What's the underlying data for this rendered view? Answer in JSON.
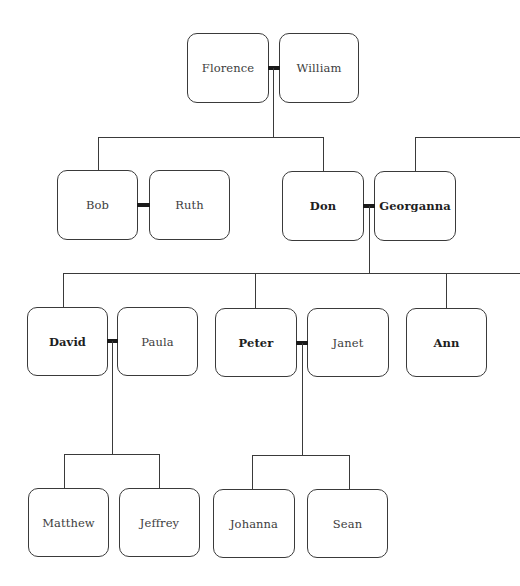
{
  "diagram": {
    "type": "family-tree",
    "colors": {
      "line": "#3a3a3a",
      "marriage_bar": "#1a1a1a",
      "box_border": "#3a3a3a",
      "background": "#ffffff"
    },
    "generations": [
      {
        "level": 1,
        "couples": [
          {
            "partner1": "Florence",
            "partner2": "William"
          }
        ]
      },
      {
        "level": 2,
        "couples": [
          {
            "partner1": "Bob",
            "partner2": "Ruth"
          },
          {
            "partner1": "Don",
            "partner2": "Georganna"
          }
        ]
      },
      {
        "level": 3,
        "couples": [
          {
            "partner1": "David",
            "partner2": "Paula"
          },
          {
            "partner1": "Peter",
            "partner2": "Janet"
          }
        ],
        "singles": [
          "Ann"
        ]
      },
      {
        "level": 4,
        "singles": [
          "Matthew",
          "Jeffrey",
          "Johanna",
          "Sean"
        ]
      }
    ],
    "people": {
      "florence": {
        "name": "Florence",
        "bold": false
      },
      "william": {
        "name": "William",
        "bold": false
      },
      "bob": {
        "name": "Bob",
        "bold": false
      },
      "ruth": {
        "name": "Ruth",
        "bold": false
      },
      "don": {
        "name": "Don",
        "bold": true
      },
      "georganna": {
        "name": "Georganna",
        "bold": true
      },
      "david": {
        "name": "David",
        "bold": true
      },
      "paula": {
        "name": "Paula",
        "bold": false
      },
      "peter": {
        "name": "Peter",
        "bold": true
      },
      "janet": {
        "name": "Janet",
        "bold": false
      },
      "ann": {
        "name": "Ann",
        "bold": true
      },
      "matthew": {
        "name": "Matthew",
        "bold": false
      },
      "jeffrey": {
        "name": "Jeffrey",
        "bold": false
      },
      "johanna": {
        "name": "Johanna",
        "bold": false
      },
      "sean": {
        "name": "Sean",
        "bold": false
      }
    },
    "relationships": [
      {
        "type": "marriage",
        "a": "Florence",
        "b": "William"
      },
      {
        "type": "children",
        "parents": [
          "Florence",
          "William"
        ],
        "children": [
          "Bob",
          "Don"
        ]
      },
      {
        "type": "marriage",
        "a": "Bob",
        "b": "Ruth"
      },
      {
        "type": "marriage",
        "a": "Don",
        "b": "Georganna"
      },
      {
        "type": "parent-offscreen",
        "child": "Georganna",
        "direction": "right"
      },
      {
        "type": "children",
        "parents": [
          "Don",
          "Georganna"
        ],
        "children": [
          "David",
          "Peter",
          "Ann"
        ],
        "continues": "right"
      },
      {
        "type": "marriage",
        "a": "David",
        "b": "Paula"
      },
      {
        "type": "marriage",
        "a": "Peter",
        "b": "Janet"
      },
      {
        "type": "children",
        "parents": [
          "David",
          "Paula"
        ],
        "children": [
          "Matthew",
          "Jeffrey"
        ]
      },
      {
        "type": "children",
        "parents": [
          "Peter",
          "Janet"
        ],
        "children": [
          "Johanna",
          "Sean"
        ]
      }
    ]
  }
}
